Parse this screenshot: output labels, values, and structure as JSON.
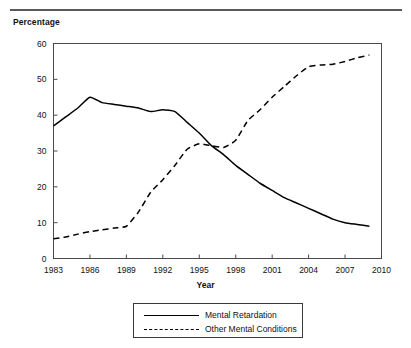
{
  "chart_data": {
    "type": "line",
    "title": "",
    "ylabel": "Percentage",
    "xlabel": "Year",
    "xlim": [
      1983,
      2010
    ],
    "ylim": [
      0,
      60
    ],
    "grid": false,
    "legend_position": "bottom",
    "xticks": [
      "1983",
      "1986",
      "1989",
      "1992",
      "1995",
      "1998",
      "2001",
      "2004",
      "2007",
      "2010"
    ],
    "xtick_values": [
      1983,
      1986,
      1989,
      1992,
      1995,
      1998,
      2001,
      2004,
      2007,
      2010
    ],
    "yticks": [
      "0",
      "10",
      "20",
      "30",
      "40",
      "50",
      "60"
    ],
    "ytick_values": [
      0,
      10,
      20,
      30,
      40,
      50,
      60
    ],
    "x": [
      1983,
      1984,
      1985,
      1986,
      1987,
      1988,
      1989,
      1990,
      1991,
      1992,
      1993,
      1994,
      1995,
      1996,
      1997,
      1998,
      1999,
      2000,
      2001,
      2002,
      2003,
      2004,
      2005,
      2006,
      2007,
      2008,
      2009
    ],
    "series": [
      {
        "name": "Mental Retardation",
        "style": "solid",
        "color": "#000000",
        "values": [
          37.0,
          39.5,
          42.0,
          45.0,
          43.5,
          43.0,
          42.5,
          42.0,
          41.0,
          41.5,
          41.0,
          38.0,
          35.0,
          31.5,
          29.0,
          26.0,
          23.5,
          21.0,
          19.0,
          17.0,
          15.5,
          14.0,
          12.5,
          11.0,
          10.0,
          9.5,
          9.0
        ]
      },
      {
        "name": "Other Mental Conditions",
        "style": "dashed",
        "color": "#000000",
        "values": [
          5.5,
          6.0,
          6.8,
          7.5,
          8.0,
          8.5,
          9.0,
          13.0,
          18.5,
          22.0,
          26.0,
          30.5,
          32.0,
          31.5,
          31.0,
          33.0,
          38.5,
          41.5,
          45.0,
          48.0,
          51.0,
          53.5,
          54.0,
          54.2,
          55.0,
          56.0,
          56.8
        ]
      }
    ]
  },
  "legend": {
    "items": [
      {
        "label": "Mental Retardation",
        "style": "solid"
      },
      {
        "label": "Other Mental Conditions",
        "style": "dashed"
      }
    ]
  },
  "axis_titles": {
    "y": "Percentage",
    "x": "Year"
  }
}
